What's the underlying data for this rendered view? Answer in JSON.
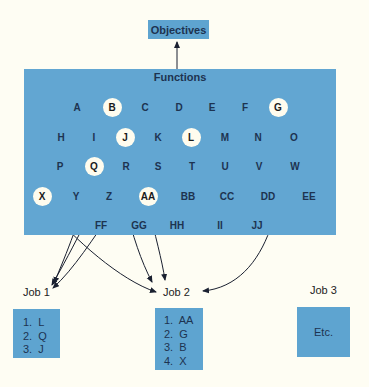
{
  "objectives": {
    "label": "Objectives"
  },
  "functions": {
    "title": "Functions",
    "items": [
      {
        "id": "A",
        "x": 77,
        "y": 107,
        "selected": false
      },
      {
        "id": "B",
        "x": 112,
        "y": 107,
        "selected": true
      },
      {
        "id": "C",
        "x": 145,
        "y": 107,
        "selected": false
      },
      {
        "id": "D",
        "x": 179,
        "y": 107,
        "selected": false
      },
      {
        "id": "E",
        "x": 212,
        "y": 107,
        "selected": false
      },
      {
        "id": "F",
        "x": 245,
        "y": 107,
        "selected": false
      },
      {
        "id": "G",
        "x": 278,
        "y": 107,
        "selected": true
      },
      {
        "id": "H",
        "x": 61,
        "y": 137,
        "selected": false
      },
      {
        "id": "I",
        "x": 94,
        "y": 137,
        "selected": false
      },
      {
        "id": "J",
        "x": 125,
        "y": 137,
        "selected": true
      },
      {
        "id": "K",
        "x": 158,
        "y": 137,
        "selected": false
      },
      {
        "id": "L",
        "x": 191,
        "y": 137,
        "selected": true
      },
      {
        "id": "M",
        "x": 225,
        "y": 137,
        "selected": false
      },
      {
        "id": "N",
        "x": 258,
        "y": 137,
        "selected": false
      },
      {
        "id": "O",
        "x": 294,
        "y": 137,
        "selected": false
      },
      {
        "id": "P",
        "x": 60,
        "y": 166,
        "selected": false
      },
      {
        "id": "Q",
        "x": 94,
        "y": 166,
        "selected": true
      },
      {
        "id": "R",
        "x": 126,
        "y": 166,
        "selected": false
      },
      {
        "id": "S",
        "x": 158,
        "y": 166,
        "selected": false
      },
      {
        "id": "T",
        "x": 192,
        "y": 166,
        "selected": false
      },
      {
        "id": "U",
        "x": 225,
        "y": 166,
        "selected": false
      },
      {
        "id": "V",
        "x": 259,
        "y": 166,
        "selected": false
      },
      {
        "id": "W",
        "x": 295,
        "y": 166,
        "selected": false
      },
      {
        "id": "X",
        "x": 42,
        "y": 196,
        "selected": true
      },
      {
        "id": "Y",
        "x": 76,
        "y": 196,
        "selected": false
      },
      {
        "id": "Z",
        "x": 109,
        "y": 196,
        "selected": false
      },
      {
        "id": "AA",
        "x": 148,
        "y": 196,
        "selected": true
      },
      {
        "id": "BB",
        "x": 188,
        "y": 196,
        "selected": false
      },
      {
        "id": "CC",
        "x": 227,
        "y": 196,
        "selected": false
      },
      {
        "id": "DD",
        "x": 268,
        "y": 196,
        "selected": false
      },
      {
        "id": "EE",
        "x": 309,
        "y": 196,
        "selected": false
      },
      {
        "id": "FF",
        "x": 101,
        "y": 225,
        "selected": false
      },
      {
        "id": "GG",
        "x": 139,
        "y": 225,
        "selected": false
      },
      {
        "id": "HH",
        "x": 177,
        "y": 225,
        "selected": false
      },
      {
        "id": "II",
        "x": 220,
        "y": 225,
        "selected": false
      },
      {
        "id": "JJ",
        "x": 257,
        "y": 225,
        "selected": false
      }
    ]
  },
  "jobs": [
    {
      "label": "Job 1",
      "items": [
        "1.  L",
        "2.  Q",
        "3.  J"
      ]
    },
    {
      "label": "Job 2",
      "items": [
        "1.  AA",
        "2.  G",
        "3.  B",
        "4.  X"
      ]
    },
    {
      "label": "Job 3",
      "etc": "Etc."
    }
  ],
  "connections": [
    {
      "from": "L",
      "to": "Job 1"
    },
    {
      "from": "Q",
      "to": "Job 1"
    },
    {
      "from": "J",
      "to": "Job 1"
    },
    {
      "from": "AA",
      "to": "Job 2"
    },
    {
      "from": "G",
      "to": "Job 2"
    },
    {
      "from": "B",
      "to": "Job 2"
    },
    {
      "from": "X",
      "to": "Job 2"
    },
    {
      "from": "Functions",
      "to": "Objectives"
    }
  ],
  "colors": {
    "background": "#fefdf3",
    "box_fill": "#62a6d2",
    "selected_circle": "#fffcee",
    "line": "#1a2030"
  }
}
